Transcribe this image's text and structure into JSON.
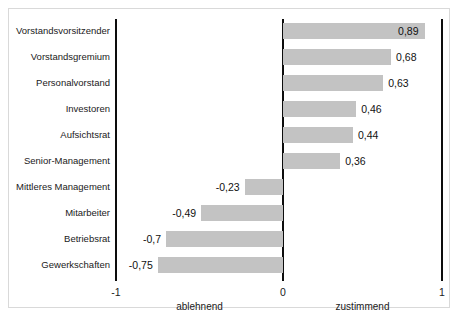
{
  "chart_data": {
    "type": "bar",
    "orientation": "horizontal",
    "title": "",
    "subtitle": "",
    "xlabel": "",
    "ylabel": "",
    "xlim": [
      -1,
      1
    ],
    "grid": false,
    "legend": null,
    "bar_color": "#c3c3c3",
    "axis_color": "#0d0d0d",
    "decimal_separator": ",",
    "categories": [
      "Vorstandsvorsitzender",
      "Vorstandsgremium",
      "Personalvorstand",
      "Investoren",
      "Aufsichtsrat",
      "Senior-Management",
      "Mittleres Management",
      "Mitarbeiter",
      "Betriebsrat",
      "Gewerkschaften"
    ],
    "values": [
      0.89,
      0.68,
      0.63,
      0.46,
      0.44,
      0.36,
      -0.23,
      -0.49,
      -0.7,
      -0.75
    ],
    "value_labels": [
      "0,89",
      "0,68",
      "0,63",
      "0,46",
      "0,44",
      "0,36",
      "-0,23",
      "-0,49",
      "-0,7",
      "-0,75"
    ],
    "label_placement": [
      "inside",
      "outside",
      "outside",
      "outside",
      "outside",
      "outside",
      "outside",
      "outside",
      "outside",
      "outside"
    ],
    "xticks": [
      -1,
      0,
      1
    ],
    "xtick_labels": [
      "-1",
      "0",
      "1"
    ],
    "axis_captions": [
      {
        "text": "ablehnend",
        "at": -0.5
      },
      {
        "text": "zustimmend",
        "at": 0.5
      }
    ]
  }
}
